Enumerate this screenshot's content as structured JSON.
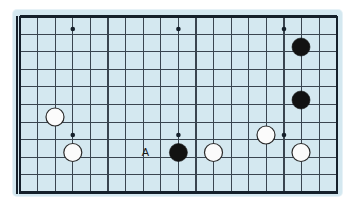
{
  "figure": {
    "kind": "go-board-diagram",
    "width": 355,
    "height": 205
  },
  "colors": {
    "page_background": "#ffffff",
    "board_background": "#d4e8f0",
    "grid_line": "#3a4550",
    "border_line": "#15202b",
    "black_stone": "#121212",
    "white_stone": "#fbfbfb",
    "white_stone_outline": "#2a2a2a",
    "label_text": "#1a1a1a"
  },
  "board": {
    "surface": {
      "x": 13,
      "y": 10,
      "width": 329,
      "height": 186,
      "corner_radius": 4
    },
    "origin": {
      "x": 20.0,
      "y": 16.5
    },
    "spacing": 17.6,
    "columns": 19,
    "rows": 11,
    "edges": {
      "left": true,
      "top": true,
      "bottom": true,
      "right": false,
      "right_clipped_note": "board continues past right crop"
    },
    "border_thickness": 2.4,
    "grid_thickness": 1.1,
    "right_clip_x": 337
  },
  "star_points": [
    {
      "col": 3,
      "row": 0,
      "x": 72.8,
      "y": 29.0
    },
    {
      "col": 9,
      "row": 0,
      "x": 178.4,
      "y": 29.0
    },
    {
      "col": 15,
      "row": 0,
      "x": 284.0,
      "y": 29.0
    },
    {
      "col": 3,
      "row": 6,
      "x": 72.8,
      "y": 135.0
    },
    {
      "col": 9,
      "row": 6,
      "x": 178.4,
      "y": 135.0
    },
    {
      "col": 15,
      "row": 6,
      "x": 284.0,
      "y": 135.0
    }
  ],
  "stones": [
    {
      "id": "b1",
      "color": "black",
      "x": 301.0,
      "y": 47.0,
      "radius": 9.0
    },
    {
      "id": "b2",
      "color": "black",
      "x": 301.0,
      "y": 100.0,
      "radius": 9.0
    },
    {
      "id": "w1",
      "color": "white",
      "x": 55.0,
      "y": 117.0,
      "radius": 9.0
    },
    {
      "id": "w2",
      "color": "white",
      "x": 72.8,
      "y": 152.5,
      "radius": 9.0
    },
    {
      "id": "b3",
      "color": "black",
      "x": 178.4,
      "y": 152.5,
      "radius": 9.0
    },
    {
      "id": "w3",
      "color": "white",
      "x": 213.5,
      "y": 152.5,
      "radius": 9.0
    },
    {
      "id": "w4",
      "color": "white",
      "x": 266.0,
      "y": 135.0,
      "radius": 9.0
    },
    {
      "id": "w5",
      "color": "white",
      "x": 301.0,
      "y": 152.5,
      "radius": 9.0
    }
  ],
  "labels": [
    {
      "id": "a",
      "text": "A",
      "x": 145.5,
      "y": 152.0
    }
  ]
}
